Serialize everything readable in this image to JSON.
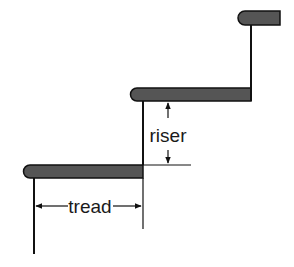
{
  "diagram": {
    "type": "stair-profile",
    "labels": {
      "tread": "tread",
      "riser": "riser"
    },
    "colors": {
      "tread_fill": "#555555",
      "line": "#111111",
      "background": "#ffffff"
    },
    "steps": [
      {
        "name": "bottom-step",
        "tread_x": [
          23,
          143
        ],
        "tread_y": [
          165,
          178
        ]
      },
      {
        "name": "middle-step",
        "tread_x": [
          130,
          251
        ],
        "tread_y": [
          88,
          101
        ]
      },
      {
        "name": "top-step",
        "tread_x": [
          238,
          280
        ],
        "tread_y": [
          11,
          25
        ]
      }
    ]
  }
}
